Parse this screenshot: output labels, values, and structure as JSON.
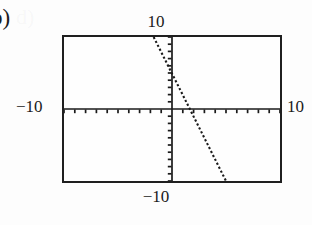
{
  "problem": {
    "item_label": "b)"
  },
  "ghost_text": "d)",
  "calculator_window": {
    "top_label": "10",
    "bottom_label": "−10",
    "left_label": "−10",
    "right_label": "10",
    "xmin": -10,
    "xmax": 10,
    "ymin": -10,
    "ymax": 10,
    "xscl": 1,
    "yscl": 1
  },
  "chart_data": {
    "type": "line",
    "title": "",
    "xlabel": "",
    "ylabel": "",
    "xlim": [
      -10,
      10
    ],
    "ylim": [
      -10,
      10
    ],
    "grid": false,
    "legend": null,
    "axes": {
      "x_axis_ticks_visible": true,
      "y_axis_ticks_visible": true,
      "x_tick_interval": 1,
      "y_tick_interval": 1
    },
    "series": [
      {
        "name": "line",
        "style": "dotted",
        "color": "#1a1a1a",
        "slope": -3,
        "y_intercept": 5,
        "x_intercept": 1.6667,
        "x": [
          -1.7,
          5.0
        ],
        "y": [
          10.0,
          -10.0
        ],
        "points": [
          {
            "x": -1.7,
            "y": 10.0
          },
          {
            "x": 0.0,
            "y": 5.0
          },
          {
            "x": 1.67,
            "y": 0.0
          },
          {
            "x": 5.0,
            "y": -10.0
          }
        ]
      }
    ]
  },
  "colors": {
    "ink": "#1a1a1a",
    "frame": "#1f1f1f",
    "page_background": "#fdfdfd"
  }
}
